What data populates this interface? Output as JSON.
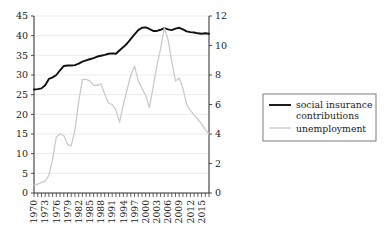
{
  "chart_data": {
    "type": "line",
    "title": "",
    "subtitle": "",
    "xlabel": "",
    "ylabel": "",
    "grid": true,
    "legend_position": "right",
    "x": [
      1970,
      1971,
      1972,
      1973,
      1974,
      1975,
      1976,
      1977,
      1978,
      1979,
      1980,
      1981,
      1982,
      1983,
      1984,
      1985,
      1986,
      1987,
      1988,
      1989,
      1990,
      1991,
      1992,
      1993,
      1994,
      1995,
      1996,
      1997,
      1998,
      1999,
      2000,
      2001,
      2002,
      2003,
      2004,
      2005,
      2006,
      2007,
      2008,
      2009,
      2010,
      2011,
      2012,
      2013,
      2014,
      2015,
      2016,
      2017
    ],
    "x_tick_labels": [
      "1970",
      "1973",
      "1976",
      "1979",
      "1982",
      "1985",
      "1988",
      "1991",
      "1994",
      "1997",
      "2000",
      "2003",
      "2006",
      "2009",
      "2012",
      "2015"
    ],
    "x_tick_values": [
      1970,
      1973,
      1976,
      1979,
      1982,
      1985,
      1988,
      1991,
      1994,
      1997,
      2000,
      2003,
      2006,
      2009,
      2012,
      2015
    ],
    "xlim": [
      1970,
      2017
    ],
    "left_axis": {
      "label": "",
      "ylim": [
        0,
        45
      ],
      "ticks": [
        0,
        5,
        10,
        15,
        20,
        25,
        30,
        35,
        40,
        45
      ]
    },
    "right_axis": {
      "label": "",
      "ylim": [
        0,
        12
      ],
      "ticks": [
        0,
        2,
        4,
        6,
        8,
        10,
        12
      ]
    },
    "series": [
      {
        "name": "social insurance contributions",
        "axis": "left",
        "color": "#111111",
        "style": "solid-thick",
        "values": [
          26.3,
          26.4,
          26.6,
          27.4,
          29.0,
          29.4,
          30.0,
          31.2,
          32.3,
          32.4,
          32.4,
          32.5,
          32.9,
          33.4,
          33.7,
          34.0,
          34.3,
          34.7,
          34.9,
          35.1,
          35.4,
          35.5,
          35.4,
          36.3,
          37.1,
          38.0,
          39.2,
          40.3,
          41.4,
          42.0,
          42.1,
          41.7,
          41.2,
          41.2,
          41.5,
          41.9,
          41.6,
          41.4,
          41.8,
          42.0,
          41.6,
          41.1,
          40.9,
          40.8,
          40.6,
          40.5,
          40.6,
          40.5
        ]
      },
      {
        "name": "unemployment",
        "axis": "right",
        "color": "#c9c9c9",
        "style": "solid-thin",
        "values": [
          0.55,
          0.6,
          0.7,
          0.8,
          1.2,
          2.3,
          3.8,
          4.0,
          3.9,
          3.3,
          3.2,
          4.3,
          6.2,
          7.7,
          7.7,
          7.6,
          7.3,
          7.3,
          7.4,
          6.7,
          6.1,
          6.0,
          5.6,
          4.8,
          6.0,
          7.0,
          8.0,
          8.6,
          7.6,
          7.1,
          6.6,
          5.8,
          7.2,
          8.6,
          9.8,
          11.2,
          10.4,
          8.9,
          7.6,
          7.8,
          7.1,
          6.0,
          5.6,
          5.3,
          5.0,
          4.7,
          4.3,
          4.0
        ]
      }
    ]
  },
  "legend": {
    "entries": [
      {
        "label_line1": "social insurance",
        "label_line2": "contributions",
        "swatch": "dark-line-swatch"
      },
      {
        "label_line1": "unemployment",
        "label_line2": "",
        "swatch": "light-line-swatch"
      }
    ]
  },
  "colors": {
    "series_dark": "#111111",
    "series_light": "#c9c9c9",
    "gridline": "#e2e2e2",
    "axis": "#3a3a3a",
    "background": "#ffffff",
    "text": "#1b1b1b"
  }
}
